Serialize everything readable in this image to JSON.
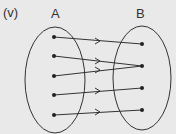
{
  "part_label": "(v)",
  "set_a": {
    "label": "A",
    "elements": 5
  },
  "set_b": {
    "label": "B",
    "elements": 4
  },
  "mapping": [
    {
      "from": 1,
      "to": 1
    },
    {
      "from": 2,
      "to": 2
    },
    {
      "from": 3,
      "to": 2
    },
    {
      "from": 4,
      "to": 3
    },
    {
      "from": 5,
      "to": 4
    }
  ],
  "colors": {
    "background": "#e9e9e9",
    "stroke": "#333333"
  }
}
